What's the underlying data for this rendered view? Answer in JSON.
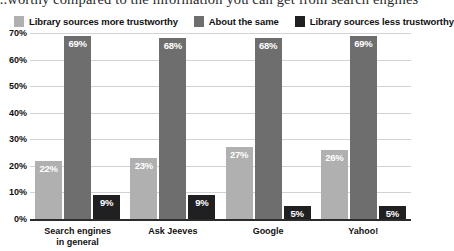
{
  "caption": {
    "text": "...worthy compared to the information you can get from search engines"
  },
  "colors": {
    "series_more": "#b0b0b0",
    "series_same": "#6e6e6e",
    "series_less": "#201f22",
    "gridline": "#d2d2d2",
    "axis": "#2b2b2b",
    "value_label": "#ffffff"
  },
  "chart_data": {
    "type": "bar",
    "title": "",
    "xlabel": "",
    "ylabel": "",
    "ylim": [
      0,
      70
    ],
    "ytick_labels": [
      "70%",
      "60%",
      "50%",
      "40%",
      "30%",
      "20%",
      "10%",
      "0%"
    ],
    "ytick_values": [
      70,
      60,
      50,
      40,
      30,
      20,
      10,
      0
    ],
    "grid": true,
    "legend_position": "top",
    "categories": [
      "Search engines\nin general",
      "Ask Jeeves",
      "Google",
      "Yahoo!"
    ],
    "series": [
      {
        "name": "Library sources more trustworthy",
        "color": "#b0b0b0",
        "values": [
          22,
          23,
          27,
          26
        ],
        "labels": [
          "22%",
          "23%",
          "27%",
          "26%"
        ]
      },
      {
        "name": "About the same",
        "color": "#6e6e6e",
        "values": [
          69,
          68,
          68,
          69
        ],
        "labels": [
          "69%",
          "68%",
          "68%",
          "69%"
        ]
      },
      {
        "name": "Library sources less trustworthy",
        "color": "#201f22",
        "values": [
          9,
          9,
          5,
          5
        ],
        "labels": [
          "9%",
          "9%",
          "5%",
          "5%"
        ]
      }
    ]
  }
}
